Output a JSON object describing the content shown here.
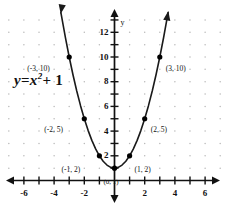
{
  "chart_data": {
    "type": "line",
    "title": "",
    "equation_label": "y = x² + 1",
    "equation_parts": {
      "y": "y",
      "equals": "=",
      "x": "x",
      "exponent": "2",
      "plus_one": "+ 1"
    },
    "xlabel": "",
    "ylabel": "y",
    "xlim": [
      -7,
      7
    ],
    "ylim": [
      -1,
      13
    ],
    "grid": true,
    "grid_style": "dots",
    "x_tick_labels": [
      "-6",
      "-4",
      "-2",
      "2",
      "4",
      "6"
    ],
    "x_tick_values": [
      -6,
      -4,
      -2,
      2,
      4,
      6
    ],
    "y_tick_labels": [
      "2",
      "4",
      "6",
      "8",
      "10",
      "12"
    ],
    "y_tick_values": [
      2,
      4,
      6,
      8,
      10,
      12
    ],
    "series": [
      {
        "name": "y = x^2 + 1",
        "x": [
          -3.55,
          -3.25,
          -3,
          -2.75,
          -2.5,
          -2.25,
          -2,
          -1.75,
          -1.5,
          -1.25,
          -1,
          -0.75,
          -0.5,
          -0.25,
          0,
          0.25,
          0.5,
          0.75,
          1,
          1.25,
          1.5,
          1.75,
          2,
          2.25,
          2.5,
          2.75,
          3,
          3.25,
          3.55
        ],
        "y": [
          13.6,
          11.56,
          10,
          8.56,
          7.25,
          6.06,
          5,
          4.06,
          3.25,
          2.56,
          2,
          1.56,
          1.25,
          1.06,
          1,
          1.06,
          1.25,
          1.56,
          2,
          2.56,
          3.25,
          4.06,
          5,
          6.06,
          7.25,
          8.56,
          10,
          11.56,
          13.6
        ]
      }
    ],
    "marked_points": [
      {
        "x": -3,
        "y": 10,
        "label": "(-3, 10)",
        "label_side": "left"
      },
      {
        "x": -2,
        "y": 5,
        "label": "(-2, 5)",
        "label_side": "left"
      },
      {
        "x": -1,
        "y": 2,
        "label": "(-1, 2)",
        "label_side": "left"
      },
      {
        "x": 0,
        "y": 1,
        "label": "(0, 1)",
        "label_side": "below"
      },
      {
        "x": 1,
        "y": 2,
        "label": "(1, 2)",
        "label_side": "right"
      },
      {
        "x": 2,
        "y": 5,
        "label": "(2, 5)",
        "label_side": "right"
      },
      {
        "x": 3,
        "y": 10,
        "label": "(3, 10)",
        "label_side": "right"
      }
    ],
    "colors": {
      "curve": "#1a1a1a",
      "axis": "#111111",
      "grid_dot": "#b9b9b9",
      "point": "#000000",
      "background": "#ffffff"
    }
  }
}
